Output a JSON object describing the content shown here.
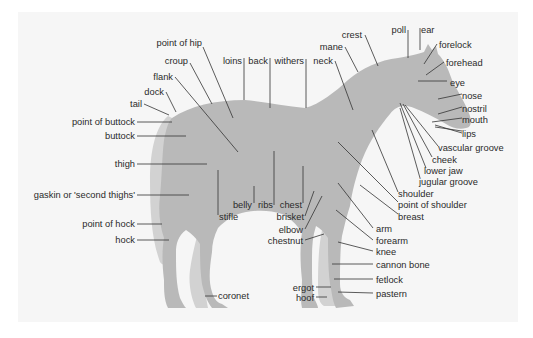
{
  "diagram": {
    "colors": {
      "background": "#ffffff",
      "panel": "#f6f6f6",
      "body": "#b9b9b9",
      "far_side": "#d0d0d0",
      "text": "#2a2a2a",
      "leader": "#333333"
    },
    "labels": {
      "point_of_hip": "point of hip",
      "croup": "croup",
      "loins": "loins",
      "back": "back",
      "withers": "withers",
      "neck": "neck",
      "mane": "mane",
      "crest": "crest",
      "poll": "poll",
      "ear": "ear",
      "forelock": "forelock",
      "forehead": "forehead",
      "eye": "eye",
      "nose": "nose",
      "nostril": "nostril",
      "mouth": "mouth",
      "lips": "lips",
      "vascular_groove": "vascular groove",
      "cheek": "cheek",
      "lower_jaw": "lower jaw",
      "jugular_groove": "jugular groove",
      "shoulder": "shoulder",
      "point_of_shoulder": "point of shoulder",
      "breast": "breast",
      "arm": "arm",
      "forearm": "forearm",
      "knee": "knee",
      "cannon_bone": "cannon bone",
      "fetlock": "fetlock",
      "pastern": "pastern",
      "hoof": "hoof",
      "ergot": "ergot",
      "chestnut": "chestnut",
      "elbow": "elbow",
      "brisket": "brisket",
      "chest": "chest",
      "ribs": "ribs",
      "belly": "belly",
      "stifle": "stifle",
      "flank": "flank",
      "dock": "dock",
      "tail": "tail",
      "point_of_buttock": "point of buttock",
      "buttock": "buttock",
      "thigh": "thigh",
      "gaskin": "gaskin or 'second thighs'",
      "point_of_hock": "point of hock",
      "hock": "hock",
      "coronet": "coronet"
    }
  }
}
